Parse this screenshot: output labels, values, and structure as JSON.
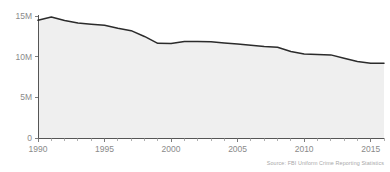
{
  "chart_data": {
    "type": "area",
    "title": "",
    "subtitle": "",
    "xlabel": "",
    "ylabel": "",
    "xlim": [
      1990,
      2016
    ],
    "ylim": [
      0,
      15000000
    ],
    "grid": false,
    "legend": "none",
    "source": "Source: FBI Uniform Crime Reporting Statistics",
    "x": [
      1990,
      1991,
      1992,
      1993,
      1994,
      1995,
      1996,
      1997,
      1998,
      1999,
      2000,
      2001,
      2002,
      2003,
      2004,
      2005,
      2006,
      2007,
      2008,
      2009,
      2010,
      2011,
      2012,
      2013,
      2014,
      2015,
      2016
    ],
    "series": [
      {
        "name": "Total crimes",
        "values": [
          14475600,
          14872900,
          14438200,
          14144800,
          13989500,
          13862700,
          13493900,
          13194600,
          12485700,
          11634400,
          11608100,
          11876700,
          11878950,
          11826500,
          11679500,
          11565500,
          11401500,
          11251800,
          11160500,
          10639400,
          10329100,
          10258800,
          10219100,
          9795700,
          9393200,
          9195400,
          9189900
        ]
      }
    ],
    "y_ticks": [
      {
        "value": 0,
        "label": "0"
      },
      {
        "value": 5000000,
        "label": "5M"
      },
      {
        "value": 10000000,
        "label": "10M"
      },
      {
        "value": 15000000,
        "label": "15M"
      }
    ],
    "x_ticks": [
      {
        "value": 1990,
        "label": "1990"
      },
      {
        "value": 1995,
        "label": "1995"
      },
      {
        "value": 2000,
        "label": "2000"
      },
      {
        "value": 2005,
        "label": "2005"
      },
      {
        "value": 2010,
        "label": "2010"
      },
      {
        "value": 2015,
        "label": "2015"
      }
    ],
    "x_minor_ticks": [
      1991,
      1992,
      1993,
      1994,
      1996,
      1997,
      1998,
      1999,
      2001,
      2002,
      2003,
      2004,
      2006,
      2007,
      2008,
      2009,
      2011,
      2012,
      2013,
      2014,
      2016
    ],
    "colors": {
      "line": "#2b2b2b",
      "area": "#efefef",
      "axis": "#555555",
      "tick_label": "#8a8a8a",
      "source_text": "#a8a8a8",
      "background": "#ffffff"
    }
  }
}
